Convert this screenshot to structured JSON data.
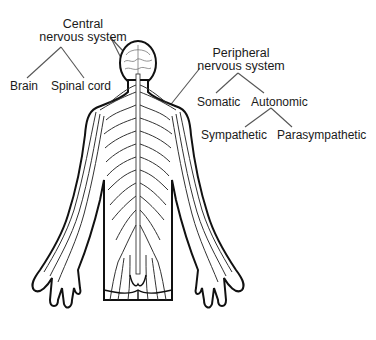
{
  "diagram": {
    "central": {
      "title_line1": "Central",
      "title_line2": "nervous system",
      "children": [
        "Brain",
        "Spinal cord"
      ]
    },
    "peripheral": {
      "title_line1": "Peripheral",
      "title_line2": "nervous system",
      "children": [
        "Somatic",
        "Autonomic"
      ],
      "autonomic_children": [
        "Sympathetic",
        "Parasympathetic"
      ]
    },
    "colors": {
      "ink": "#1a1a1a",
      "line": "#555555",
      "background": "#ffffff"
    }
  }
}
